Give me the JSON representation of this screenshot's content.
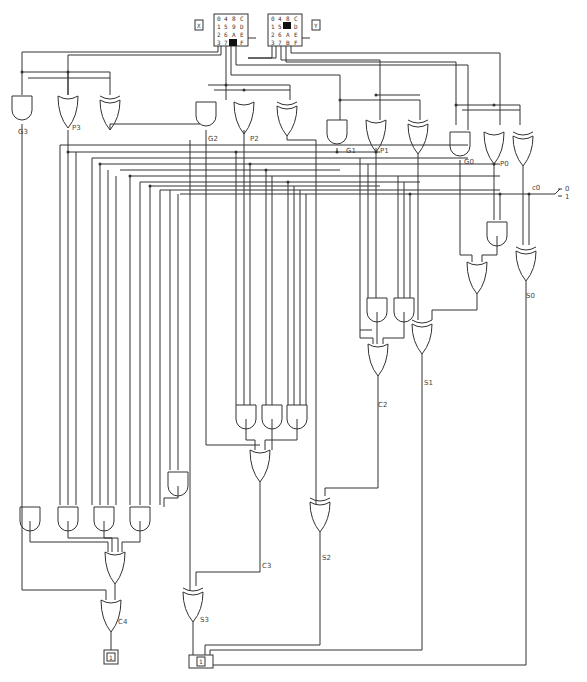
{
  "inputs": {
    "x": {
      "label": "X",
      "keys": [
        "0",
        "4",
        "8",
        "C",
        "1",
        "5",
        "9",
        "D",
        "2",
        "6",
        "A",
        "E",
        "3",
        "7",
        "B",
        "F"
      ],
      "selected": "B"
    },
    "y": {
      "label": "Y",
      "keys": [
        "0",
        "4",
        "8",
        "C",
        "1",
        "5",
        "9",
        "D",
        "2",
        "6",
        "A",
        "E",
        "3",
        "7",
        "B",
        "F"
      ],
      "selected": "9"
    }
  },
  "carry_in": {
    "label": "c0",
    "options": [
      "0",
      "1"
    ],
    "value": "1"
  },
  "gate_labels": {
    "g3": "G3",
    "p3": "P3",
    "g2": "G2",
    "p2": "P2",
    "g1": "G1",
    "p1": "P1",
    "g0": "G0",
    "p0": "P0"
  },
  "signal_labels": {
    "s0": "S0",
    "s1": "S1",
    "s2": "S2",
    "s3": "S3",
    "c2": "C2",
    "c3": "C3",
    "c4": "C4"
  },
  "outputs": {
    "c4_display": "1",
    "sum_display": "1"
  }
}
